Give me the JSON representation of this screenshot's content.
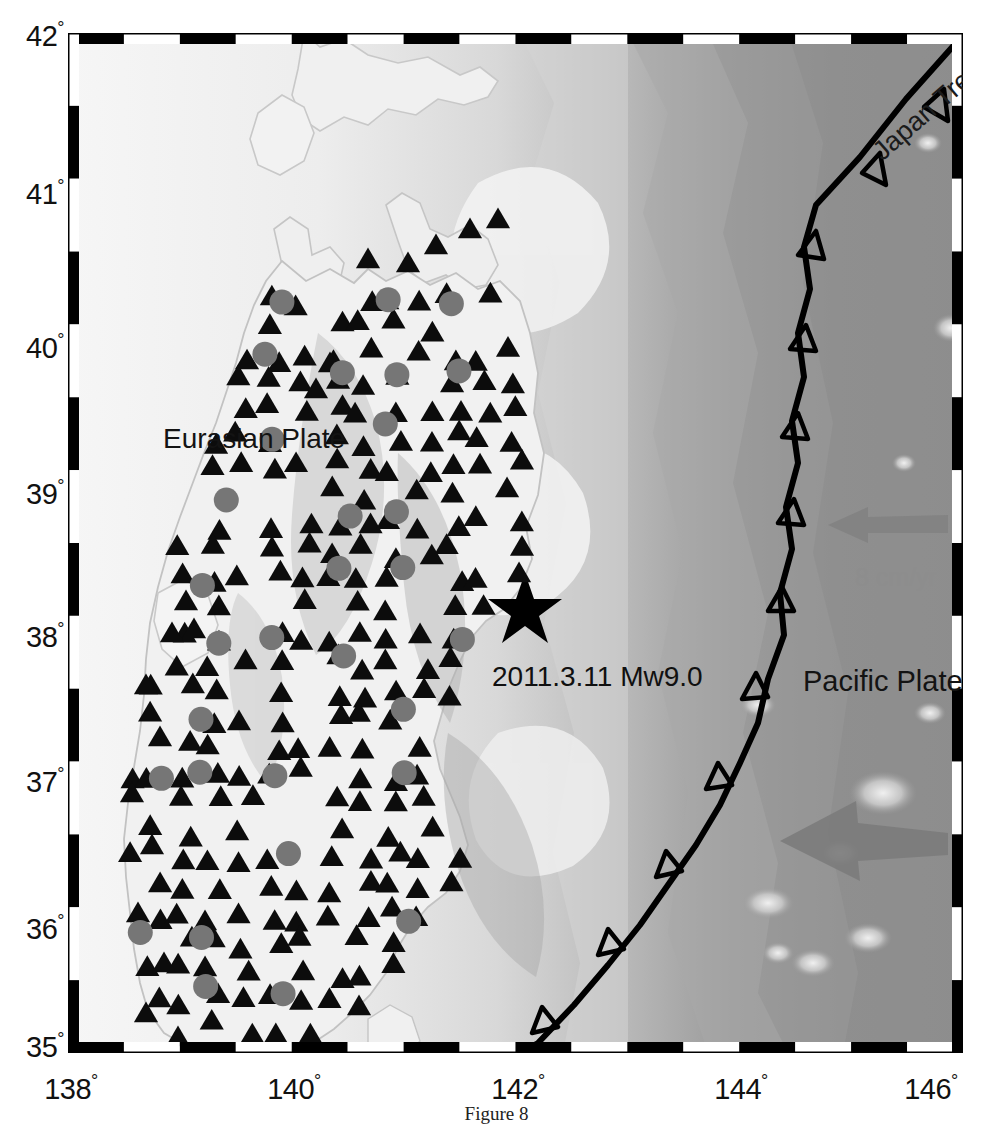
{
  "figure": {
    "caption": "Figure 8",
    "type": "map"
  },
  "map": {
    "projection_bounds": {
      "lon_min": 138,
      "lon_max": 146,
      "lat_min": 35,
      "lat_max": 42
    },
    "frame": {
      "tick_interval_deg": 0.5,
      "style": "alternating-black-white-bar",
      "border_color": "#000000"
    },
    "axes": {
      "latitude": {
        "label_suffix": "°",
        "ticks": [
          "42",
          "41",
          "40",
          "39",
          "38",
          "37",
          "36",
          "35"
        ]
      },
      "longitude": {
        "label_suffix": "°",
        "ticks": [
          "138",
          "140",
          "142",
          "144",
          "146"
        ]
      }
    },
    "annotations": [
      {
        "name": "eurasian-plate-label",
        "text": "Eurasian Plate",
        "color": "#131313"
      },
      {
        "name": "pacific-plate-label",
        "text": "Pacific Plate",
        "color": "#131313"
      },
      {
        "name": "japan-trench-label",
        "text": "Japan Trench",
        "color": "#1b1b1b",
        "rotation_deg": -41
      },
      {
        "name": "earthquake-label",
        "text": "2011.3.11 Mw9.0",
        "color": "#101010"
      },
      {
        "name": "plate-motion-label",
        "text": "8 cm/yr",
        "color": "#8d8d8d"
      }
    ],
    "symbols": {
      "epicenter": {
        "glyph": "star",
        "color": "#000000",
        "lon": 142.35,
        "lat": 38.3
      },
      "station_triangle": {
        "glyph": "triangle",
        "color": "#0c0c0c",
        "count_approx": 230
      },
      "station_circle": {
        "glyph": "circle",
        "color": "#777777",
        "count_approx": 42
      },
      "trench_line": {
        "color": "#000000",
        "teeth": "open-triangle",
        "teeth_direction": "west"
      },
      "motion_arrow": {
        "color": "#7b7b7b",
        "direction": "west-northwest",
        "count": 2
      }
    },
    "colors": {
      "land_light": "#f2f2f2",
      "shallow_ocean": "#e8e8e8",
      "deep_ocean": "#8b8b8b",
      "trench_dark": "#787878",
      "frame": "#000000"
    }
  },
  "chart_data": {
    "type": "map",
    "xlabel": "Longitude",
    "ylabel": "Latitude",
    "xlim": [
      138,
      146
    ],
    "ylim": [
      35,
      42
    ],
    "xticks": [
      138,
      140,
      142,
      144,
      146
    ],
    "yticks": [
      35,
      36,
      37,
      38,
      39,
      40,
      41,
      42
    ],
    "legend_entries": [
      "Eurasian Plate",
      "Pacific Plate",
      "Japan Trench",
      "2011.3.11 Mw9.0",
      "8 cm/yr"
    ],
    "grid": false,
    "points": [
      {
        "series": "epicenter",
        "lon": 142.35,
        "lat": 38.3,
        "label": "2011.3.11 Mw9.0"
      }
    ]
  }
}
